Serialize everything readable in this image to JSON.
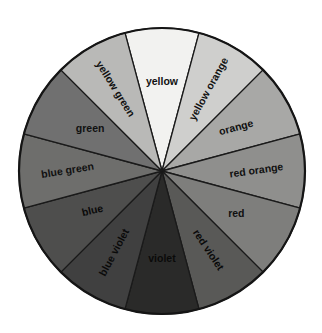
{
  "figure": {
    "type": "color-wheel-diagram",
    "background_color": "#ffffff",
    "outline_color": "#151515",
    "divider_color": "#1a1a1a",
    "center_x": 162,
    "center_y": 171,
    "radius": 143,
    "segment_count": 12,
    "segment_span_degrees": 30
  },
  "chart_data": {
    "type": "pie",
    "xlabel": "",
    "ylabel": "",
    "categories": [
      "yellow",
      "yellow orange",
      "orange",
      "red orange",
      "red",
      "red violet",
      "violet",
      "blue violet",
      "blue",
      "blue green",
      "green",
      "yellow green"
    ],
    "values": [
      30,
      30,
      30,
      30,
      30,
      30,
      30,
      30,
      30,
      30,
      30,
      30
    ],
    "colors": [
      "#f2f2f0",
      "#cfcfcd",
      "#a8a8a6",
      "#8f8f8d",
      "#7e7e7c",
      "#595957",
      "#2a2a29",
      "#404040",
      "#4e4e4d",
      "#6e6e6c",
      "#707070",
      "#b9b9b7"
    ],
    "legend": "none",
    "grid": false
  },
  "segments": [
    {
      "label": "yellow",
      "color": "#f2f2f0",
      "start_deg": -15,
      "end_deg": 15,
      "label_radius": 0.62,
      "label_rotation": 0
    },
    {
      "label": "yellow orange",
      "color": "#cfcfcd",
      "start_deg": 15,
      "end_deg": 45,
      "label_radius": 0.66,
      "label_rotation": -61
    },
    {
      "label": "orange",
      "color": "#a8a8a6",
      "start_deg": 45,
      "end_deg": 75,
      "label_radius": 0.6,
      "label_rotation": -15
    },
    {
      "label": "red orange",
      "color": "#8f8f8d",
      "start_deg": 75,
      "end_deg": 105,
      "label_radius": 0.66,
      "label_rotation": -8
    },
    {
      "label": "red",
      "color": "#7e7e7c",
      "start_deg": 105,
      "end_deg": 135,
      "label_radius": 0.6,
      "label_rotation": 0
    },
    {
      "label": "red violet",
      "color": "#595957",
      "start_deg": 135,
      "end_deg": 165,
      "label_radius": 0.64,
      "label_rotation": 56
    },
    {
      "label": "violet",
      "color": "#2a2a29",
      "start_deg": 165,
      "end_deg": 195,
      "label_radius": 0.62,
      "label_rotation": 0
    },
    {
      "label": "blue violet",
      "color": "#404040",
      "start_deg": 195,
      "end_deg": 225,
      "label_radius": 0.66,
      "label_rotation": -62
    },
    {
      "label": "blue",
      "color": "#4e4e4d",
      "start_deg": 225,
      "end_deg": 255,
      "label_radius": 0.56,
      "label_rotation": -13
    },
    {
      "label": "blue green",
      "color": "#6e6e6c",
      "start_deg": 255,
      "end_deg": 285,
      "label_radius": 0.66,
      "label_rotation": -9
    },
    {
      "label": "green",
      "color": "#707070",
      "start_deg": 285,
      "end_deg": 315,
      "label_radius": 0.58,
      "label_rotation": 0
    },
    {
      "label": "yellow green",
      "color": "#b9b9b7",
      "start_deg": 315,
      "end_deg": 345,
      "label_radius": 0.66,
      "label_rotation": 58
    }
  ]
}
